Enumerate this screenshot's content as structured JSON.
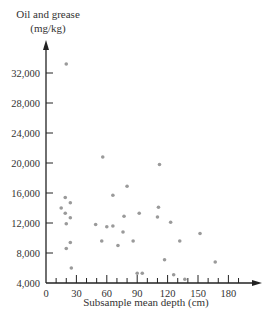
{
  "chart_data": {
    "type": "scatter",
    "title": "",
    "ylabel_lines": [
      "Oil and grease",
      "(mg/kg)"
    ],
    "ylabel": "Oil and grease (mg/kg)",
    "xlabel": "Subsample mean depth (cm)",
    "xlim": [
      0,
      200
    ],
    "ylim": [
      4000,
      36000
    ],
    "x_ticks": [
      0,
      30,
      60,
      90,
      120,
      150,
      180
    ],
    "x_tick_labels": [
      "0",
      "30",
      "60",
      "90",
      "120",
      "150",
      "180"
    ],
    "x_minor_tick_step": 10,
    "y_ticks": [
      4000,
      8000,
      12000,
      16000,
      20000,
      24000,
      28000,
      32000
    ],
    "y_tick_labels": [
      "4,000",
      "8,000",
      "12,000",
      "16,000",
      "20,000",
      "24,000",
      "28,000",
      "32,000"
    ],
    "grid": false,
    "legend": null,
    "point_color": "#9a9a9a",
    "points": [
      {
        "x": 20,
        "y": 33200
      },
      {
        "x": 19,
        "y": 15400
      },
      {
        "x": 24,
        "y": 14700
      },
      {
        "x": 15,
        "y": 14000
      },
      {
        "x": 19,
        "y": 13300
      },
      {
        "x": 24,
        "y": 12700
      },
      {
        "x": 20,
        "y": 11900
      },
      {
        "x": 24,
        "y": 9400
      },
      {
        "x": 20,
        "y": 8600
      },
      {
        "x": 25,
        "y": 6000
      },
      {
        "x": 49,
        "y": 11800
      },
      {
        "x": 55,
        "y": 9600
      },
      {
        "x": 56,
        "y": 20800
      },
      {
        "x": 60,
        "y": 11500
      },
      {
        "x": 66,
        "y": 11600
      },
      {
        "x": 66,
        "y": 15700
      },
      {
        "x": 71,
        "y": 9000
      },
      {
        "x": 76,
        "y": 10800
      },
      {
        "x": 77,
        "y": 12900
      },
      {
        "x": 80,
        "y": 16900
      },
      {
        "x": 86,
        "y": 9600
      },
      {
        "x": 90,
        "y": 5300
      },
      {
        "x": 92,
        "y": 13300
      },
      {
        "x": 95,
        "y": 5300
      },
      {
        "x": 110,
        "y": 12800
      },
      {
        "x": 111,
        "y": 14100
      },
      {
        "x": 112,
        "y": 19800
      },
      {
        "x": 117,
        "y": 7100
      },
      {
        "x": 123,
        "y": 12100
      },
      {
        "x": 126,
        "y": 5100
      },
      {
        "x": 132,
        "y": 9600
      },
      {
        "x": 137,
        "y": 4500
      },
      {
        "x": 152,
        "y": 10600
      },
      {
        "x": 167,
        "y": 6800
      }
    ]
  }
}
